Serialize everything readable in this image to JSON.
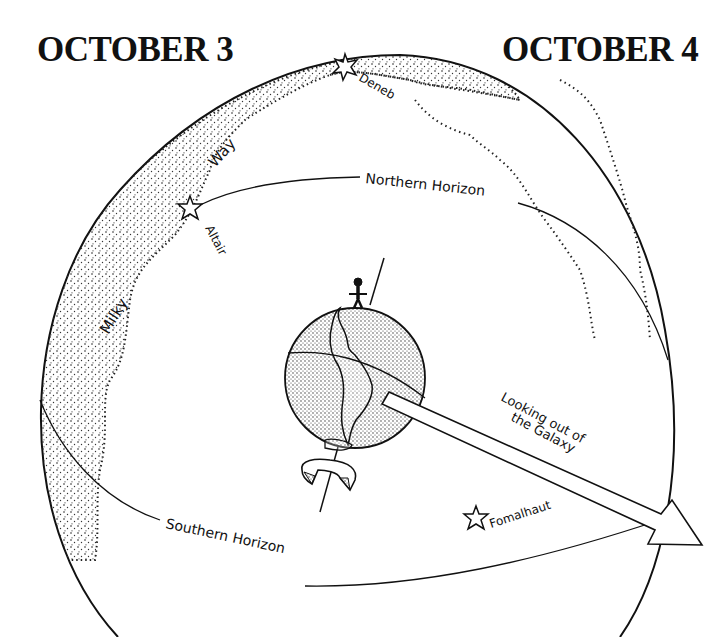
{
  "titles": {
    "left": "OCTOBER 3",
    "right": "OCTOBER 4"
  },
  "labels": {
    "milky": "Milky",
    "way": "Way",
    "deneb": "Deneb",
    "altair": "Altair",
    "fomalhaut": "Fomalhaut",
    "northern_horizon": "Northern Horizon",
    "southern_horizon": "Southern Horizon",
    "looking_line1": "Looking out of",
    "looking_line2": "the Galaxy"
  },
  "stars": [
    {
      "name": "Deneb",
      "x": 345,
      "y": 65
    },
    {
      "name": "Altair",
      "x": 190,
      "y": 208
    },
    {
      "name": "Fomalhaut",
      "x": 476,
      "y": 517
    }
  ],
  "colors": {
    "ink": "#111111",
    "background": "#ffffff"
  }
}
